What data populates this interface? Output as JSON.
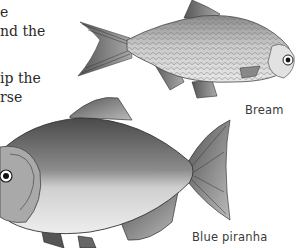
{
  "body_text": {
    "lines": [
      "e",
      "nd the",
      "ip the",
      "rse"
    ]
  },
  "figures": [
    {
      "caption": "Bream",
      "icon": "bream-fish-illustration"
    },
    {
      "caption": "Blue piranha",
      "icon": "blue-piranha-fish-illustration"
    }
  ],
  "colors": {
    "text": "#2a2a2a",
    "caption": "#3a3a3a",
    "background": "#ffffff"
  }
}
